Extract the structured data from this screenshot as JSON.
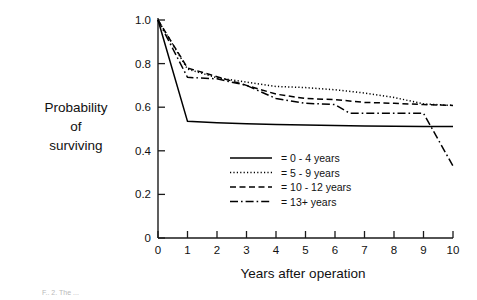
{
  "figure": {
    "caption": "F.. 2. The ..."
  },
  "chart_data": {
    "type": "line",
    "title": "",
    "subtitle": "",
    "xlabel": "Years after operation",
    "ylabel": "Probability of surviving",
    "ylabel_lines": [
      "Probability",
      "of",
      "surviving"
    ],
    "xlim": [
      0,
      10
    ],
    "ylim": [
      0,
      1.0
    ],
    "grid": false,
    "legend_position": "center",
    "x_ticks": [
      0,
      1,
      2,
      3,
      4,
      5,
      6,
      7,
      8,
      9,
      10
    ],
    "x_tick_labels": [
      "0",
      "1",
      "2",
      "3",
      "4",
      "5",
      "6",
      "7",
      "8",
      "9",
      "10"
    ],
    "y_ticks": [
      0,
      0.2,
      0.4,
      0.6,
      0.8,
      1.0
    ],
    "y_tick_labels": [
      "0",
      "0.2",
      "0.4",
      "0.6",
      "0.8",
      "1.0"
    ],
    "series": [
      {
        "name": "0 - 4 years",
        "legend_label": "= 0 - 4 years",
        "style": "solid",
        "color": "#000000",
        "x": [
          0,
          1,
          2,
          3,
          4,
          5,
          6,
          7,
          8,
          9,
          10
        ],
        "values": [
          1.0,
          0.535,
          0.529,
          0.524,
          0.521,
          0.518,
          0.516,
          0.514,
          0.513,
          0.512,
          0.511
        ]
      },
      {
        "name": "5 - 9 years",
        "legend_label": "= 5 - 9 years",
        "style": "dotted",
        "color": "#000000",
        "x": [
          0,
          1,
          2,
          3,
          4,
          5,
          6,
          7,
          8,
          9,
          10
        ],
        "values": [
          1.0,
          0.775,
          0.735,
          0.715,
          0.695,
          0.69,
          0.68,
          0.665,
          0.645,
          0.615,
          0.608
        ]
      },
      {
        "name": "10 - 12 years",
        "legend_label": "= 10 - 12 years",
        "style": "dashed",
        "color": "#000000",
        "x": [
          0,
          1,
          2,
          3,
          4,
          5,
          6,
          7,
          8,
          9,
          10
        ],
        "values": [
          1.0,
          0.78,
          0.74,
          0.7,
          0.66,
          0.64,
          0.635,
          0.622,
          0.618,
          0.612,
          0.608
        ]
      },
      {
        "name": "13+ years",
        "legend_label": "= 13+ years",
        "style": "dashdot",
        "color": "#000000",
        "x": [
          0,
          1,
          2,
          3,
          4,
          5,
          6,
          6.5,
          7,
          8,
          9,
          10
        ],
        "values": [
          1.0,
          0.737,
          0.73,
          0.7,
          0.64,
          0.618,
          0.612,
          0.572,
          0.572,
          0.572,
          0.572,
          0.33
        ]
      }
    ],
    "legend_entries": [
      {
        "label": "= 0 - 4 years",
        "style": "solid"
      },
      {
        "label": "= 5 - 9 years",
        "style": "dotted"
      },
      {
        "label": "= 10 - 12 years",
        "style": "dashed"
      },
      {
        "label": "= 13+ years",
        "style": "dashdot"
      }
    ]
  }
}
